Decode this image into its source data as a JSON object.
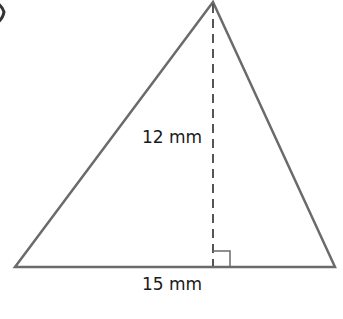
{
  "figure": {
    "type": "triangle",
    "colors": {
      "outline": "#6b6b6b",
      "dashed_altitude": "#555555",
      "text": "#1a1a1a"
    },
    "vertices": {
      "apex": [
        213,
        2
      ],
      "base_left": [
        15,
        267
      ],
      "base_right": [
        335,
        267
      ]
    },
    "height_label": "12 mm",
    "base_label": "15 mm",
    "right_angle_marker": true
  }
}
